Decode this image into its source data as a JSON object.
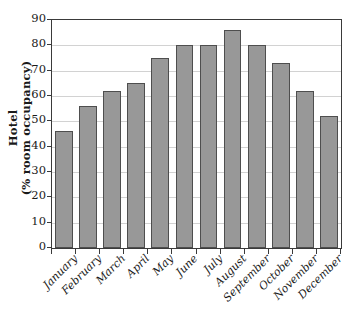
{
  "chart_data": {
    "type": "bar",
    "title": "",
    "subtitle": "",
    "xlabel": "",
    "ylabel": "Hotel (% room occupancy)",
    "ylabel_line1": "Hotel",
    "ylabel_line2": "(% room occupancy)",
    "categories": [
      "January",
      "February",
      "March",
      "April",
      "May",
      "June",
      "July",
      "August",
      "September",
      "October",
      "November",
      "December"
    ],
    "values": [
      46,
      56,
      62,
      65,
      75,
      80,
      80,
      86,
      80,
      73,
      62,
      52
    ],
    "ylim": [
      0,
      90
    ],
    "ytick_values": [
      0,
      10,
      20,
      30,
      40,
      50,
      60,
      70,
      80,
      90
    ],
    "ytick_labels": [
      "0",
      "10",
      "20",
      "30",
      "40",
      "50",
      "60",
      "70",
      "80",
      "90"
    ],
    "ytick_step": 10,
    "grid": true,
    "grid_axis": "y",
    "legend": false,
    "legend_position": "none",
    "bar_color": "#989898",
    "bar_border_color": "#4e4e4e",
    "grid_color": "#d2d2d2",
    "axis_color": "#3a3a3a",
    "background_color": "#ffffff",
    "xlabel_rotation": -45,
    "ylabel_rotation": -90
  }
}
